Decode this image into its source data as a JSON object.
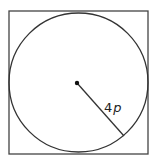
{
  "figure": {
    "square": {
      "x": 9,
      "y": 11,
      "width": 139,
      "height": 143,
      "stroke": "#444444",
      "stroke_width": 1.3
    },
    "circle": {
      "cx": 78.5,
      "cy": 82.5,
      "r": 69.5,
      "stroke": "#333333",
      "stroke_width": 1.3
    },
    "center_point": {
      "cx": 77,
      "cy": 83,
      "r": 2.2,
      "fill": "#111111"
    },
    "radius_line": {
      "x1": 77,
      "y1": 83,
      "x2": 124,
      "y2": 136,
      "stroke": "#333333",
      "stroke_width": 1.3
    },
    "radius_label": {
      "coefficient": "4",
      "variable": "p",
      "x": 104,
      "y": 112
    }
  }
}
